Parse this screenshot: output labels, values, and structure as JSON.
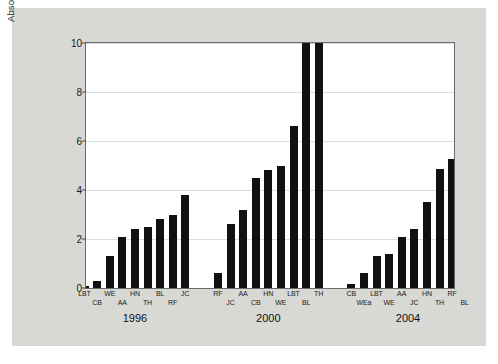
{
  "chart_data": {
    "type": "bar",
    "title": "",
    "xlabel": "",
    "ylabel": "Absolute Prediction Error (Percentage Points)",
    "ylim": [
      0,
      10
    ],
    "yticks": [
      0,
      2,
      4,
      6,
      8,
      10
    ],
    "ytick_labels": [
      "0",
      "2",
      "4",
      "6",
      "8",
      "10"
    ],
    "grid": true,
    "legend": "none",
    "note": "Bars clipped at top of axis exceed 10; drawn to axis maximum.",
    "groups": [
      {
        "label": "1996",
        "categories": [
          "LBT",
          "CB",
          "WE",
          "AA",
          "HN",
          "TH",
          "BL",
          "RF",
          "JC"
        ],
        "values": [
          0.1,
          0.3,
          1.3,
          2.1,
          2.4,
          2.5,
          2.8,
          3.0,
          3.8
        ]
      },
      {
        "label": "2000",
        "categories": [
          "RF",
          "JC",
          "AA",
          "CB",
          "HN",
          "WE",
          "LBT",
          "BL",
          "TH"
        ],
        "values": [
          0.6,
          2.6,
          3.2,
          4.5,
          4.8,
          5.0,
          6.6,
          10.0,
          10.0
        ]
      },
      {
        "label": "2004",
        "categories": [
          "CB",
          "WEa",
          "LBT",
          "WE",
          "AA",
          "JC",
          "HN",
          "TH",
          "RF",
          "BL"
        ],
        "values": [
          0.15,
          0.6,
          1.3,
          1.4,
          2.1,
          2.4,
          3.5,
          4.85,
          5.25,
          5.35
        ]
      }
    ]
  }
}
